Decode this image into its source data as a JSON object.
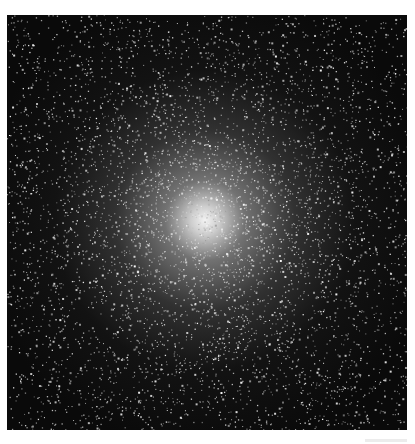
{
  "image": {
    "subject": "globular star cluster",
    "description": "Dense globular cluster of stars with a bright central core fading into a sparse black star field",
    "colors": {
      "background": "#0a0a0a",
      "core": "#f5f5f5",
      "page": "#ffffff"
    },
    "core_center": [
      205,
      220
    ]
  }
}
